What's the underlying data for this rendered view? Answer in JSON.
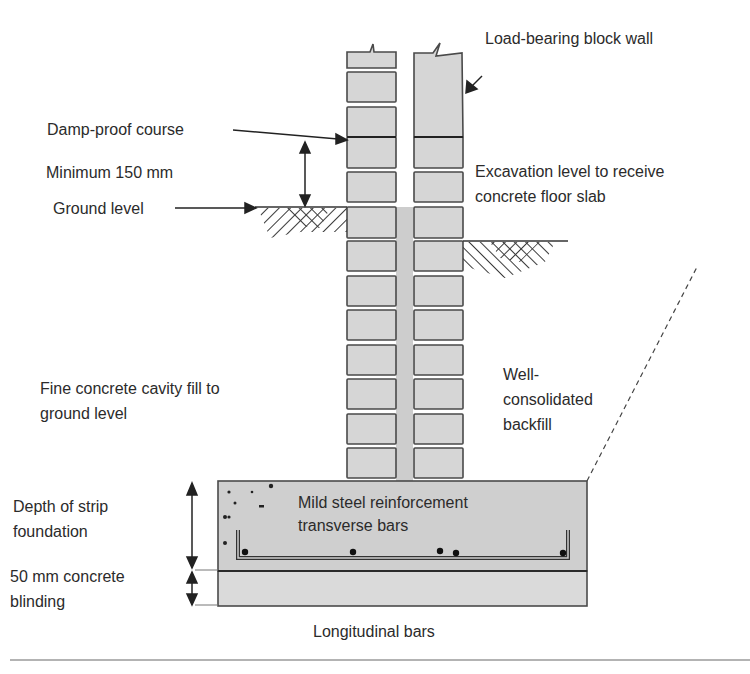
{
  "diagram": {
    "labels": {
      "load_bearing_wall": "Load-bearing block wall",
      "damp_proof_course": "Damp-proof course",
      "minimum_150": "Minimum 150 mm",
      "ground_level": "Ground level",
      "excavation_line1": "Excavation level to receive",
      "excavation_line2": "concrete floor slab",
      "cavity_fill_line1": "Fine concrete cavity fill to",
      "cavity_fill_line2": "ground level",
      "backfill_line1": "Well-",
      "backfill_line2": "consolidated",
      "backfill_line3": "backfill",
      "depth_line1": "Depth of strip",
      "depth_line2": "foundation",
      "blinding_line1": "50 mm concrete",
      "blinding_line2": "blinding",
      "reinforcement_line1": "Mild steel reinforcement",
      "reinforcement_line2": "transverse bars",
      "longitudinal": "Longitudinal bars"
    },
    "colors": {
      "block_fill": "#d6d6d6",
      "block_edge": "#4a4a4a",
      "concrete_fill": "#cfcfcf",
      "blinding_fill": "#dadada",
      "text": "#2b2b2b",
      "rule": "#9a9a9a"
    }
  }
}
